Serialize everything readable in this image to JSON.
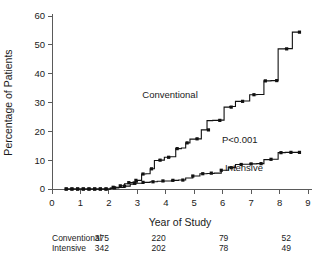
{
  "chart_data": {
    "type": "line",
    "title": "",
    "xlabel": "Year of Study",
    "ylabel": "Percentage of Patients",
    "xlim": [
      0,
      9
    ],
    "ylim": [
      0,
      60
    ],
    "xticks": [
      "0",
      "1",
      "2",
      "3",
      "4",
      "5",
      "6",
      "7",
      "8",
      "9"
    ],
    "yticks": [
      "0",
      "10",
      "20",
      "30",
      "40",
      "50",
      "60"
    ],
    "grid": false,
    "legend_position": "inline-annotation",
    "annotations": [
      {
        "text": "Conventional",
        "x": 4.15,
        "y": 31.5
      },
      {
        "text": "Intensive",
        "x": 6.75,
        "y": 6.2
      },
      {
        "text": "P<0.001",
        "x": 6.6,
        "y": 15.8
      }
    ],
    "series": [
      {
        "name": "Conventional",
        "step": "post",
        "x": [
          0.5,
          0.7,
          0.9,
          1.1,
          1.3,
          1.5,
          1.7,
          1.9,
          2.05,
          2.15,
          2.25,
          2.4,
          2.55,
          2.7,
          2.85,
          3.0,
          3.15,
          3.3,
          3.45,
          3.6,
          3.75,
          3.95,
          4.15,
          4.35,
          4.55,
          4.7,
          4.85,
          5.05,
          5.25,
          5.45,
          5.65,
          5.85,
          6.05,
          6.25,
          6.45,
          6.7,
          6.95,
          7.2,
          7.45,
          7.7,
          7.95,
          8.2,
          8.45,
          8.7
        ],
        "values": [
          0.0,
          0.0,
          0.0,
          0.0,
          0.0,
          0.0,
          0.0,
          0.0,
          0.3,
          0.6,
          0.6,
          1.1,
          1.8,
          2.2,
          2.4,
          3.0,
          5.2,
          5.3,
          7.0,
          9.9,
          10.0,
          11.0,
          11.2,
          14.0,
          14.2,
          16.0,
          17.3,
          17.4,
          20.5,
          23.7,
          23.8,
          23.9,
          28.4,
          28.6,
          30.4,
          30.5,
          32.7,
          32.8,
          37.5,
          37.6,
          48.6,
          48.7,
          54.4,
          54.5
        ],
        "censor_x": [
          0.5,
          0.7,
          0.9,
          1.1,
          1.3,
          1.5,
          1.7,
          1.9,
          2.15,
          2.4,
          2.7,
          2.95,
          3.2,
          3.5,
          3.8,
          4.1,
          4.4,
          4.75,
          5.1,
          5.5,
          5.9,
          6.3,
          6.7,
          7.1,
          7.5,
          7.9,
          8.25,
          8.7
        ],
        "censor_y": [
          0.0,
          0.0,
          0.0,
          0.0,
          0.0,
          0.0,
          0.0,
          0.0,
          0.6,
          1.1,
          2.2,
          3.0,
          5.2,
          7.0,
          10.0,
          11.0,
          14.0,
          16.0,
          17.4,
          20.5,
          23.8,
          28.4,
          30.4,
          32.7,
          37.5,
          37.6,
          48.6,
          54.4
        ]
      },
      {
        "name": "Intensive",
        "step": "post",
        "x": [
          0.5,
          0.7,
          0.9,
          1.1,
          1.3,
          1.5,
          1.7,
          1.9,
          2.05,
          2.2,
          2.35,
          2.55,
          2.75,
          2.95,
          3.2,
          3.45,
          3.7,
          3.95,
          4.2,
          4.45,
          4.7,
          4.95,
          5.2,
          5.45,
          5.7,
          5.95,
          6.2,
          6.45,
          6.7,
          6.95,
          7.2,
          7.45,
          7.7,
          7.95,
          8.2,
          8.45,
          8.7
        ],
        "values": [
          0.0,
          0.0,
          0.0,
          0.0,
          0.0,
          0.0,
          0.0,
          0.0,
          0.2,
          0.4,
          0.5,
          1.0,
          1.7,
          2.0,
          2.3,
          2.5,
          2.7,
          2.8,
          3.0,
          3.1,
          3.8,
          4.5,
          5.3,
          5.4,
          5.5,
          6.5,
          7.4,
          8.5,
          8.6,
          8.7,
          8.8,
          10.2,
          10.3,
          12.6,
          12.7,
          12.7,
          12.7
        ],
        "censor_x": [
          0.5,
          0.7,
          0.9,
          1.1,
          1.3,
          1.5,
          1.7,
          1.9,
          2.2,
          2.55,
          2.9,
          3.2,
          3.55,
          3.9,
          4.25,
          4.6,
          4.95,
          5.3,
          5.6,
          5.95,
          6.3,
          6.65,
          7.0,
          7.35,
          7.7,
          8.05,
          8.4,
          8.7
        ],
        "censor_y": [
          0.0,
          0.0,
          0.0,
          0.0,
          0.0,
          0.0,
          0.0,
          0.0,
          0.4,
          1.0,
          2.0,
          2.3,
          2.5,
          2.8,
          3.0,
          3.1,
          4.5,
          5.3,
          5.5,
          6.5,
          7.4,
          8.5,
          8.7,
          8.8,
          10.3,
          12.6,
          12.7,
          12.7
        ]
      }
    ]
  },
  "risk_table": {
    "rows": [
      {
        "label": "Conventional",
        "values": [
          "375",
          "220",
          "79",
          "52"
        ]
      },
      {
        "label": "Intensive",
        "values": [
          "342",
          "202",
          "78",
          "49"
        ]
      }
    ],
    "value_x": [
      2.0,
      4.0,
      6.2,
      8.4
    ]
  }
}
